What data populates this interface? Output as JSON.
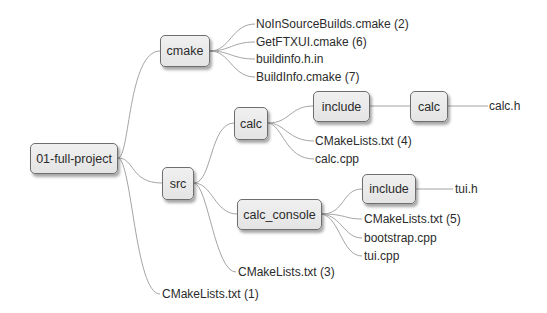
{
  "diagram": {
    "type": "mind-map / directory tree",
    "root": {
      "label": "01-full-project"
    },
    "nodes": {
      "cmake": {
        "label": "cmake"
      },
      "src": {
        "label": "src"
      },
      "calc": {
        "label": "calc"
      },
      "calc_include": {
        "label": "include"
      },
      "calc_include_calc": {
        "label": "calc"
      },
      "calc_console": {
        "label": "calc_console"
      },
      "calc_console_include": {
        "label": "include"
      }
    },
    "leaves": {
      "noinsource": "NoInSourceBuilds.cmake (2)",
      "getftxui": "GetFTXUI.cmake (6)",
      "buildinfo_h_in": "buildinfo.h.in",
      "buildinfo_cmake": "BuildInfo.cmake (7)",
      "calc_h": "calc.h",
      "calc_cmakelists": "CMakeLists.txt (4)",
      "calc_cpp": "calc.cpp",
      "tui_h": "tui.h",
      "console_cmakelists": "CMakeLists.txt (5)",
      "bootstrap_cpp": "bootstrap.cpp",
      "tui_cpp": "tui.cpp",
      "src_cmakelists": "CMakeLists.txt (3)",
      "root_cmakelists": "CMakeLists.txt (1)"
    },
    "tree": {
      "01-full-project": [
        "cmake",
        "src",
        "CMakeLists.txt (1)"
      ],
      "cmake": [
        "NoInSourceBuilds.cmake (2)",
        "GetFTXUI.cmake (6)",
        "buildinfo.h.in",
        "BuildInfo.cmake (7)"
      ],
      "src": [
        "calc",
        "calc_console",
        "CMakeLists.txt (3)"
      ],
      "calc": [
        "include",
        "CMakeLists.txt (4)",
        "calc.cpp"
      ],
      "calc/include": [
        "calc"
      ],
      "calc/include/calc": [
        "calc.h"
      ],
      "calc_console": [
        "include",
        "CMakeLists.txt (5)",
        "bootstrap.cpp",
        "tui.cpp"
      ],
      "calc_console/include": [
        "tui.h"
      ]
    },
    "colors": {
      "node_fill": "#e8e8e8",
      "node_border": "#6e6e6e",
      "connector": "#9a9a9a",
      "text": "#2b2b2b"
    }
  }
}
